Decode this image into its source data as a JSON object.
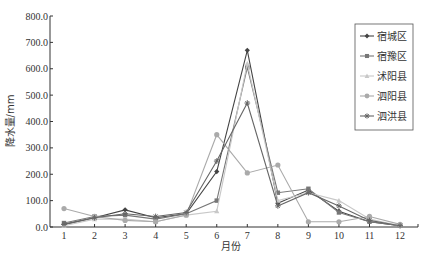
{
  "chart_data": {
    "type": "line",
    "title": "",
    "xlabel": "月份",
    "ylabel": "降水量/mm",
    "x": [
      1,
      2,
      3,
      4,
      5,
      6,
      7,
      8,
      9,
      10,
      11,
      12
    ],
    "ylim": [
      0,
      800
    ],
    "yticks": [
      "0.0",
      "100.0",
      "200.0",
      "300.0",
      "400.0",
      "500.0",
      "600.0",
      "700.0",
      "800.0"
    ],
    "grid": false,
    "legend_position": "upper right",
    "series": [
      {
        "name": "宿城区",
        "marker": "diamond",
        "color": "#444444",
        "values": [
          10,
          35,
          65,
          35,
          50,
          210,
          670,
          90,
          140,
          60,
          20,
          5
        ]
      },
      {
        "name": "宿豫区",
        "marker": "square",
        "color": "#777777",
        "values": [
          15,
          40,
          45,
          30,
          50,
          100,
          605,
          130,
          145,
          55,
          20,
          5
        ]
      },
      {
        "name": "沭阳县",
        "marker": "triangle",
        "color": "#c8c8c8",
        "values": [
          5,
          30,
          30,
          20,
          45,
          60,
          620,
          100,
          130,
          100,
          30,
          5
        ]
      },
      {
        "name": "泗阳县",
        "marker": "circle",
        "color": "#aaaaaa",
        "values": [
          70,
          40,
          25,
          20,
          45,
          350,
          205,
          235,
          20,
          20,
          40,
          10
        ]
      },
      {
        "name": "泗洪县",
        "marker": "asterisk",
        "color": "#666666",
        "values": [
          10,
          35,
          50,
          40,
          55,
          250,
          470,
          80,
          130,
          80,
          25,
          5
        ]
      }
    ]
  }
}
